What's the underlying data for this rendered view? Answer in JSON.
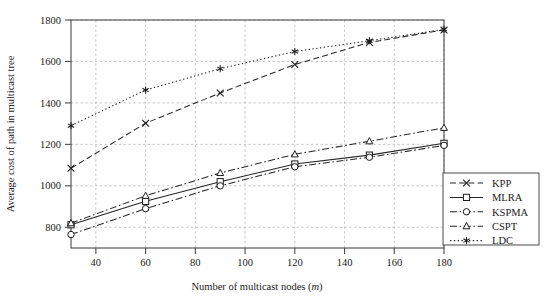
{
  "chart_data": {
    "type": "line",
    "title": "",
    "xlabel": "Number of multicast nodes (m)",
    "xlabel_plain": "Number of multicast nodes (",
    "xlabel_italic": "m",
    "xlabel_close": ")",
    "ylabel": "Average cost of path in multicast tree",
    "xlim": [
      30,
      180
    ],
    "ylim": [
      700,
      1800
    ],
    "x": [
      30,
      60,
      90,
      120,
      150,
      180
    ],
    "xticks": [
      40,
      60,
      80,
      100,
      120,
      140,
      160,
      180
    ],
    "yticks": [
      800,
      1000,
      1200,
      1400,
      1600,
      1800
    ],
    "grid": true,
    "legend_position": "bottom-right-outside",
    "series": [
      {
        "name": "KPP",
        "marker": "x-cross",
        "linestyle": "dashed",
        "color": "#262626",
        "values": [
          1085,
          1302,
          1448,
          1585,
          1692,
          1752
        ]
      },
      {
        "name": "MLRA",
        "marker": "square",
        "linestyle": "solid",
        "color": "#262626",
        "values": [
          812,
          925,
          1020,
          1105,
          1148,
          1205
        ]
      },
      {
        "name": "KSPMA",
        "marker": "circle",
        "linestyle": "dash-dot",
        "color": "#262626",
        "values": [
          765,
          890,
          1000,
          1092,
          1138,
          1195
        ]
      },
      {
        "name": "CSPT",
        "marker": "triangle",
        "linestyle": "dash-dot",
        "color": "#262626",
        "values": [
          820,
          952,
          1062,
          1152,
          1215,
          1280
        ]
      },
      {
        "name": "LDC",
        "marker": "asterisk",
        "linestyle": "dotted",
        "color": "#262626",
        "values": [
          1290,
          1462,
          1565,
          1648,
          1700,
          1755
        ]
      }
    ]
  },
  "legend": {
    "items": [
      {
        "label": "KPP"
      },
      {
        "label": "MLRA"
      },
      {
        "label": "KSPMA"
      },
      {
        "label": "CSPT"
      },
      {
        "label": "LDC"
      }
    ]
  },
  "axis": {
    "ytick_labels": [
      "800",
      "1000",
      "1200",
      "1400",
      "1600",
      "1800"
    ],
    "xtick_labels": [
      "40",
      "60",
      "80",
      "100",
      "120",
      "140",
      "160",
      "180"
    ]
  }
}
